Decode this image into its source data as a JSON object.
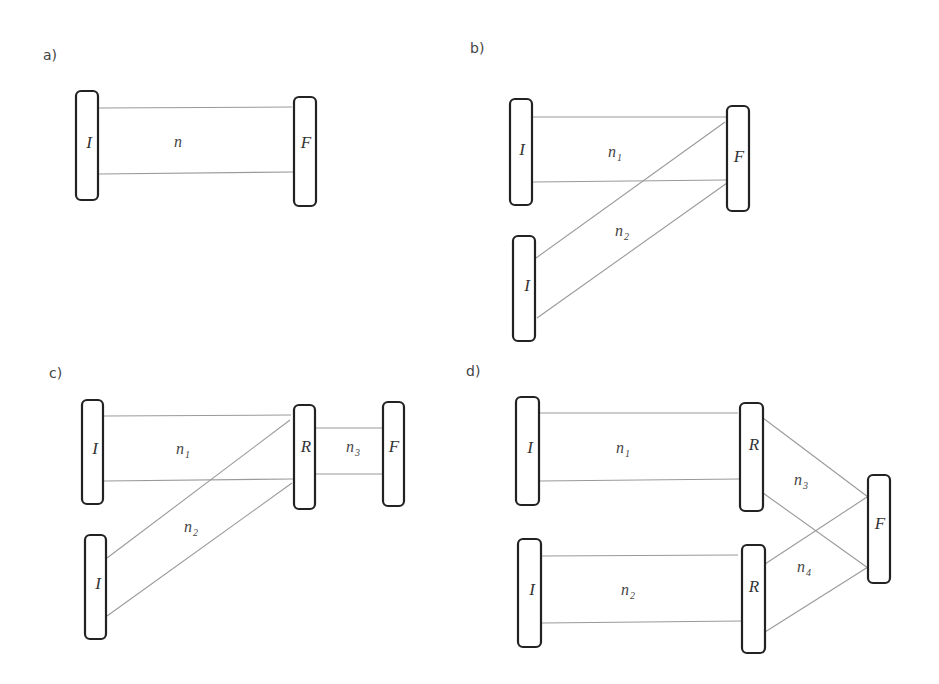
{
  "figure": {
    "panels": [
      {
        "id": "a",
        "label": "a)",
        "nodes": [
          {
            "id": "a-I",
            "label": "I"
          },
          {
            "id": "a-F",
            "label": "F"
          }
        ],
        "edges": [
          {
            "from": "a-I",
            "to": "a-F",
            "group": "n"
          }
        ],
        "edge_labels": [
          {
            "base": "n",
            "sub": ""
          }
        ]
      },
      {
        "id": "b",
        "label": "b)",
        "nodes": [
          {
            "id": "b-I1",
            "label": "I"
          },
          {
            "id": "b-I2",
            "label": "I"
          },
          {
            "id": "b-F",
            "label": "F"
          }
        ],
        "edges": [
          {
            "from": "b-I1",
            "to": "b-F",
            "group": "n1"
          },
          {
            "from": "b-I2",
            "to": "b-F",
            "group": "n2"
          }
        ],
        "edge_labels": [
          {
            "base": "n",
            "sub": "1"
          },
          {
            "base": "n",
            "sub": "2"
          }
        ]
      },
      {
        "id": "c",
        "label": "c)",
        "nodes": [
          {
            "id": "c-I1",
            "label": "I"
          },
          {
            "id": "c-I2",
            "label": "I"
          },
          {
            "id": "c-R",
            "label": "R"
          },
          {
            "id": "c-F",
            "label": "F"
          }
        ],
        "edges": [
          {
            "from": "c-I1",
            "to": "c-R",
            "group": "n1"
          },
          {
            "from": "c-I2",
            "to": "c-R",
            "group": "n2"
          },
          {
            "from": "c-R",
            "to": "c-F",
            "group": "n3"
          }
        ],
        "edge_labels": [
          {
            "base": "n",
            "sub": "1"
          },
          {
            "base": "n",
            "sub": "2"
          },
          {
            "base": "n",
            "sub": "3"
          }
        ]
      },
      {
        "id": "d",
        "label": "d)",
        "nodes": [
          {
            "id": "d-I1",
            "label": "I"
          },
          {
            "id": "d-I2",
            "label": "I"
          },
          {
            "id": "d-R1",
            "label": "R"
          },
          {
            "id": "d-R2",
            "label": "R"
          },
          {
            "id": "d-F",
            "label": "F"
          }
        ],
        "edges": [
          {
            "from": "d-I1",
            "to": "d-R1",
            "group": "n1"
          },
          {
            "from": "d-I2",
            "to": "d-R2",
            "group": "n2"
          },
          {
            "from": "d-R1",
            "to": "d-F",
            "group": "n3"
          },
          {
            "from": "d-R2",
            "to": "d-F",
            "group": "n4"
          }
        ],
        "edge_labels": [
          {
            "base": "n",
            "sub": "1"
          },
          {
            "base": "n",
            "sub": "2"
          },
          {
            "base": "n",
            "sub": "3"
          },
          {
            "base": "n",
            "sub": "4"
          }
        ]
      }
    ]
  }
}
